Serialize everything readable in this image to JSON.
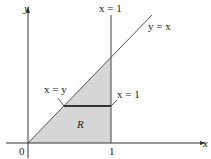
{
  "diagram": {
    "axes": {
      "x_label": "x",
      "y_label": "y",
      "origin_label": "0",
      "x_tick_label": "1"
    },
    "lines": {
      "vertical_line_label": "x = 1",
      "diagonal_line_label": "y = x"
    },
    "segment": {
      "left_end_label": "x = y",
      "right_end_label": "x = 1"
    },
    "region": {
      "label": "R",
      "fill_color": "#d9d9d9"
    }
  }
}
